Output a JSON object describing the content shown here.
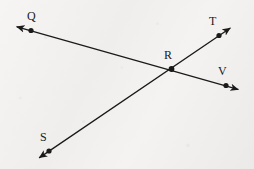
{
  "figure": {
    "kind": "geometry-diagram",
    "width": 254,
    "height": 169,
    "background_color": "#f2f1ef",
    "stroke_color": "#1a1a1a",
    "label_color": "#1a1a1a",
    "stroke_width": 1.3,
    "dot_radius": 2.6
  },
  "lines": [
    {
      "id": "line-q-v",
      "name": "line-QRV",
      "from_label": "Q",
      "through_label": "R",
      "to_label": "V",
      "x1": 31,
      "y1": 30.5,
      "x2": 226,
      "y2": 85.5,
      "arrow_start": {
        "x": 13,
        "y": 26.0
      },
      "arrow_end": {
        "x": 241,
        "y": 90.5
      }
    },
    {
      "id": "line-s-t",
      "name": "line-SRT",
      "from_label": "S",
      "through_label": "R",
      "to_label": "T",
      "x1": 49,
      "y1": 151.0,
      "x2": 219,
      "y2": 35.5,
      "arrow_start": {
        "x": 36,
        "y": 160.0
      },
      "arrow_end": {
        "x": 233,
        "y": 26.0
      }
    }
  ],
  "points": [
    {
      "id": "point-q",
      "label": "Q",
      "x": 31,
      "y": 30.5,
      "label_x": 27,
      "label_y": 10
    },
    {
      "id": "point-t",
      "label": "T",
      "x": 219,
      "y": 35.5,
      "label_x": 209,
      "label_y": 15
    },
    {
      "id": "point-r",
      "label": "R",
      "x": 171.5,
      "y": 69.0,
      "label_x": 164,
      "label_y": 49
    },
    {
      "id": "point-v",
      "label": "V",
      "x": 226,
      "y": 85.5,
      "label_x": 218,
      "label_y": 65
    },
    {
      "id": "point-s",
      "label": "S",
      "x": 49,
      "y": 151.0,
      "label_x": 40,
      "label_y": 131
    }
  ]
}
